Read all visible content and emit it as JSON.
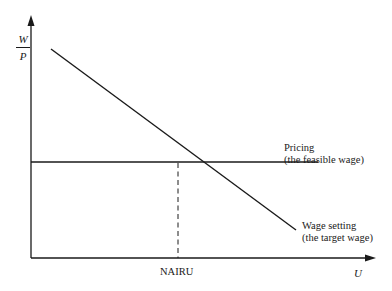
{
  "diagram": {
    "y_axis_label": {
      "numerator": "W",
      "denominator": "P"
    },
    "x_axis_label": "U",
    "equilibrium_label": "NAIRU",
    "curves": [
      {
        "name": "Pricing",
        "sublabel": "(the feasible wage)",
        "type": "horizontal"
      },
      {
        "name": "Wage setting",
        "sublabel": "(the target wage)",
        "type": "downward-sloping"
      }
    ]
  },
  "colors": {
    "line": "#1a1a1a",
    "background": "#ffffff"
  }
}
